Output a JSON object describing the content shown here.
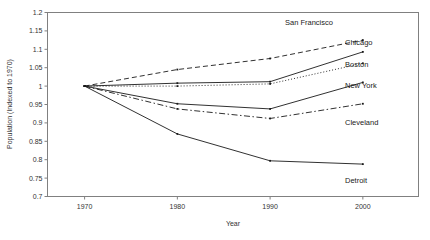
{
  "chart_data": {
    "type": "line",
    "title": "",
    "xlabel": "Year",
    "ylabel": "Population (Indexed to 1970)",
    "x": [
      1970,
      1980,
      1990,
      2000
    ],
    "xtick_labels": [
      "1970",
      "1980",
      "1990",
      "2000"
    ],
    "ytick_labels": [
      "0.7",
      "0.75",
      "0.8",
      "0.85",
      "0.9",
      "0.95",
      "1",
      "1.05",
      "1.1",
      "1.15",
      "1.2"
    ],
    "ytick_values": [
      0.7,
      0.75,
      0.8,
      0.85,
      0.9,
      0.95,
      1.0,
      1.05,
      1.1,
      1.15,
      1.2
    ],
    "ylim": [
      0.7,
      1.2
    ],
    "xlim": [
      1966,
      2006
    ],
    "grid": false,
    "legend_position": "right-inline-labels",
    "series": [
      {
        "name": "San Francisco",
        "values": [
          1.0,
          1.045,
          1.075,
          1.125
        ],
        "style": "dashed",
        "label_x": 2000,
        "label_y": 1.165
      },
      {
        "name": "Chicago",
        "values": [
          1.0,
          1.008,
          1.012,
          1.093
        ],
        "style": "solid",
        "label_x": 2000,
        "label_y": 1.112
      },
      {
        "name": "Boston",
        "values": [
          1.0,
          1.0,
          1.006,
          1.062
        ],
        "style": "dotted",
        "label_x": 2000,
        "label_y": 1.052
      },
      {
        "name": "New York",
        "values": [
          1.0,
          0.952,
          0.938,
          1.01
        ],
        "style": "solid",
        "label_x": 2000,
        "label_y": 0.995
      },
      {
        "name": "Cleveland",
        "values": [
          1.0,
          0.938,
          0.912,
          0.952
        ],
        "style": "dashdot",
        "label_x": 2000,
        "label_y": 0.893
      },
      {
        "name": "Detroit",
        "values": [
          1.0,
          0.87,
          0.797,
          0.788
        ],
        "style": "solid",
        "label_x": 2000,
        "label_y": 0.737
      }
    ]
  },
  "axes": {
    "y_title": "Population (Indexed to 1970)",
    "x_title": "Year"
  },
  "colors": {
    "line": "#1a1a1a",
    "frame": "#808080",
    "text": "#333333",
    "background": "#ffffff"
  }
}
